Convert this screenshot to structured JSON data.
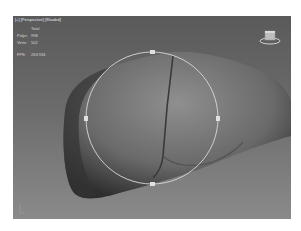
{
  "viewport": {
    "label": "[+] [Perspective] [Shaded]",
    "stats": {
      "header": "Total",
      "rows": [
        {
          "key": "Polys:",
          "value": "998"
        },
        {
          "key": "Verts:",
          "value": "502"
        }
      ],
      "fps_key": "FPS:",
      "fps_value": "263.934"
    },
    "object": "liver-model",
    "gizmo": "rotate-gizmo",
    "colors": {
      "background_top": "#5a5a5a",
      "background_bottom": "#8a8a8a",
      "gizmo": "#d9d9d9"
    }
  }
}
